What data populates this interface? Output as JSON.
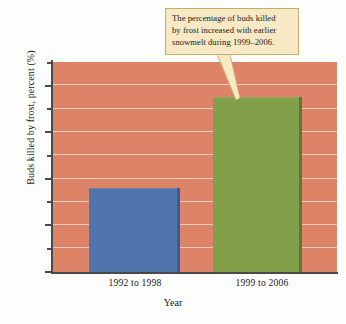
{
  "chart_data": {
    "type": "bar",
    "title": "",
    "subtitle": "",
    "categories": [
      "1992 to 1998",
      "1999 to 2006"
    ],
    "values": [
      36,
      75
    ],
    "series": [
      {
        "name": "Buds killed by frost",
        "values": [
          36,
          75
        ]
      }
    ],
    "xlabel": "Year",
    "ylabel": "Buds killed by frost, percent (%)",
    "ylim": [
      0,
      90
    ],
    "yticks": [
      0,
      20,
      40,
      60,
      80
    ],
    "ytick_labels": [
      "0",
      "20",
      "40",
      "60",
      "80"
    ],
    "minor_tick_interval": 10,
    "grid": true,
    "grid_orientation": "horizontal",
    "legend": false,
    "legend_position": "none",
    "annotations": [
      {
        "text": "The percentage of buds killed by frost increased with earlier snowmelt during 1999–2006.",
        "points_to_category": "1999 to 2006"
      }
    ],
    "bar_colors": [
      "#5274ad",
      "#82a04a"
    ],
    "plot_background": "#dd8468",
    "annotation_background": "#f7e9c4",
    "annotation_border": "#c9ab6a"
  },
  "axes": {
    "y_title": "Buds killed by frost, percent (%)",
    "x_title": "Year",
    "y_labels": {
      "t80": "80",
      "t60": "60",
      "t40": "40",
      "t20": "20",
      "t0": "0"
    }
  },
  "categories": {
    "cat0": "1992 to 1998",
    "cat1": "1999 to 2006"
  },
  "callout": {
    "line1": "The percentage of buds killed",
    "line2": "by frost increased with earlier",
    "line3": "snowmelt during 1999–2006."
  }
}
